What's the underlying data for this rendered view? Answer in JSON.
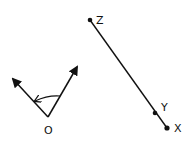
{
  "diagram": {
    "angle": {
      "vertex_label": "O",
      "vertex": [
        48,
        117
      ],
      "ray_left_tip": [
        11,
        76
      ],
      "ray_right_tip": [
        79,
        64
      ],
      "arc_direction": "counterclockwise (right ray to left ray)"
    },
    "segment": {
      "points": [
        {
          "label": "Z",
          "pos": [
            90,
            20
          ]
        },
        {
          "label": "Y",
          "pos": [
            155,
            113
          ]
        },
        {
          "label": "X",
          "pos": [
            167,
            128
          ]
        }
      ]
    },
    "colors": {
      "stroke": "#111111",
      "background": "#ffffff"
    }
  }
}
